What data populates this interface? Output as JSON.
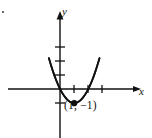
{
  "figure": {
    "width": 152,
    "height": 138,
    "background": "#ffffff",
    "ink_color": "#111111"
  },
  "labels": {
    "x_axis": "x",
    "y_axis": "y",
    "vertex_point": "(1, −1)"
  },
  "chart_data": {
    "type": "line",
    "title": "",
    "subtitle": "",
    "xlabel": "x",
    "ylabel": "y",
    "curve_equation": "y = x^2 - 2x",
    "grid": false,
    "legend": null,
    "xlim": [
      -2.9,
      5.2
    ],
    "ylim": [
      -1.9,
      5.4
    ],
    "origin_px": [
      60,
      89
    ],
    "unit_px": {
      "x": 14.2,
      "y": 14.2
    },
    "x_ticks": [
      1,
      2,
      3
    ],
    "y_ticks": [
      1,
      2,
      3,
      -1
    ],
    "annotations": [
      {
        "text": "(1, −1)",
        "x": 1,
        "y": -1,
        "marker": "filled-circle"
      }
    ],
    "x": [
      -0.78,
      -0.6,
      -0.4,
      -0.2,
      0,
      0.2,
      0.4,
      0.6,
      0.8,
      1,
      1.2,
      1.4,
      1.6,
      1.8,
      2,
      2.2,
      2.4,
      2.6,
      2.78
    ],
    "values": [
      2.17,
      1.56,
      0.96,
      0.44,
      0,
      -0.36,
      -0.64,
      -0.84,
      -0.96,
      -1,
      -0.96,
      -0.84,
      -0.64,
      -0.36,
      0,
      0.44,
      0.96,
      1.56,
      2.17
    ],
    "series": [
      {
        "name": "parabola",
        "values": [
          2.17,
          1.56,
          0.96,
          0.44,
          0,
          -0.36,
          -0.64,
          -0.84,
          -0.96,
          -1,
          -0.96,
          -0.84,
          -0.64,
          -0.36,
          0,
          0.44,
          0.96,
          1.56,
          2.17
        ]
      }
    ]
  }
}
